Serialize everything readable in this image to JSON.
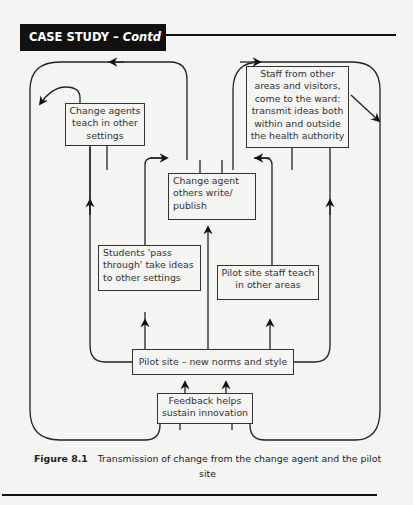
{
  "header": {
    "title_main": "CASE STUDY – ",
    "title_italic": "Contd"
  },
  "diagram": {
    "boxes": {
      "change_agents_teach": "Change agents teach in other settings",
      "staff_visitors": "Staff from other areas and visitors, come to the ward: transmit ideas both within and outside the health authority",
      "change_agent_others": "Change agent others write/ publish",
      "students": "Students 'pass through' take ideas to other settings",
      "pilot_staff_teach": "Pilot site staff teach in other areas",
      "pilot_site": "Pilot site – new norms and style",
      "feedback": "Feedback helps sustain innovation"
    }
  },
  "caption": {
    "label": "Figure 8.1",
    "text": "Transmission of change from the change agent and the pilot site"
  }
}
